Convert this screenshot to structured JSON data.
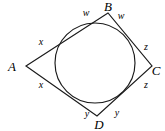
{
  "figure": {
    "type": "geometry-diagram",
    "background_color": "#ffffff",
    "stroke_color": "#1a1a1a",
    "canvas": {
      "width": 165,
      "height": 131
    }
  },
  "circle": {
    "name": "inscribed-circle",
    "cx": 95,
    "cy": 63,
    "r": 40
  },
  "quadrilateral": {
    "name": "quadrilateral-ABCD",
    "points": "26,66 108,13 152,66 97,116",
    "vertices": [
      {
        "id": "A",
        "label": "A",
        "x": 26,
        "y": 66,
        "label_x": 12,
        "label_y": 66
      },
      {
        "id": "B",
        "label": "B",
        "x": 108,
        "y": 13,
        "label_x": 108,
        "label_y": 5
      },
      {
        "id": "C",
        "label": "C",
        "x": 152,
        "y": 66,
        "label_x": 156,
        "label_y": 70
      },
      {
        "id": "D",
        "label": "D",
        "x": 97,
        "y": 116,
        "label_x": 99,
        "label_y": 125
      }
    ]
  },
  "segment_labels": [
    {
      "id": "w-left",
      "label": "w",
      "x": 86,
      "y": 13
    },
    {
      "id": "w-right",
      "label": "w",
      "x": 121,
      "y": 16
    },
    {
      "id": "x-upper",
      "label": "x",
      "x": 41,
      "y": 42
    },
    {
      "id": "x-lower",
      "label": "x",
      "x": 41,
      "y": 85
    },
    {
      "id": "z-upper",
      "label": "z",
      "x": 146,
      "y": 47
    },
    {
      "id": "z-lower",
      "label": "z",
      "x": 146,
      "y": 85
    },
    {
      "id": "y-left",
      "label": "y",
      "x": 87,
      "y": 114
    },
    {
      "id": "y-right",
      "label": "y",
      "x": 117,
      "y": 113
    }
  ]
}
